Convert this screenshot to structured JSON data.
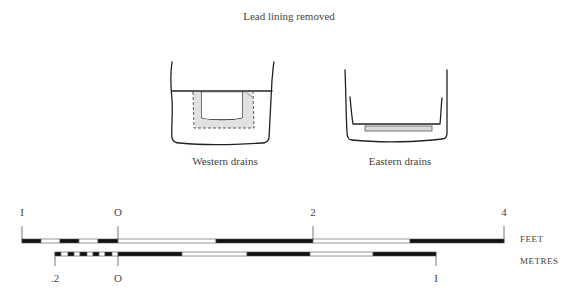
{
  "title": "Lead lining removed",
  "drawings": [
    {
      "id": "western",
      "caption": "Western drains"
    },
    {
      "id": "eastern",
      "caption": "Eastern drains"
    }
  ],
  "scales": {
    "feet": {
      "unit_label": "FEET",
      "ticks": [
        {
          "label": "I",
          "x": 22
        },
        {
          "label": "O",
          "x": 118
        },
        {
          "label": "2",
          "x": 313
        },
        {
          "label": "4",
          "x": 504
        }
      ],
      "segments": [
        {
          "x0": 22,
          "x1": 41,
          "fill": "black"
        },
        {
          "x0": 41,
          "x1": 60,
          "fill": "white"
        },
        {
          "x0": 60,
          "x1": 79,
          "fill": "black"
        },
        {
          "x0": 79,
          "x1": 98,
          "fill": "white"
        },
        {
          "x0": 98,
          "x1": 118,
          "fill": "black"
        },
        {
          "x0": 118,
          "x1": 216,
          "fill": "white"
        },
        {
          "x0": 216,
          "x1": 313,
          "fill": "black"
        },
        {
          "x0": 313,
          "x1": 410,
          "fill": "white"
        },
        {
          "x0": 410,
          "x1": 504,
          "fill": "black"
        }
      ]
    },
    "metres": {
      "unit_label": "METRES",
      "ticks": [
        {
          "label": ".2",
          "x": 55
        },
        {
          "label": "O",
          "x": 118
        },
        {
          "label": "I",
          "x": 436
        }
      ],
      "segments": [
        {
          "x0": 55,
          "x1": 61,
          "fill": "black"
        },
        {
          "x0": 61,
          "x1": 68,
          "fill": "white"
        },
        {
          "x0": 68,
          "x1": 74,
          "fill": "black"
        },
        {
          "x0": 74,
          "x1": 80,
          "fill": "white"
        },
        {
          "x0": 80,
          "x1": 87,
          "fill": "black"
        },
        {
          "x0": 87,
          "x1": 93,
          "fill": "white"
        },
        {
          "x0": 93,
          "x1": 99,
          "fill": "black"
        },
        {
          "x0": 99,
          "x1": 105,
          "fill": "white"
        },
        {
          "x0": 105,
          "x1": 112,
          "fill": "black"
        },
        {
          "x0": 112,
          "x1": 118,
          "fill": "white"
        },
        {
          "x0": 118,
          "x1": 182,
          "fill": "black"
        },
        {
          "x0": 182,
          "x1": 247,
          "fill": "white"
        },
        {
          "x0": 247,
          "x1": 310,
          "fill": "black"
        },
        {
          "x0": 310,
          "x1": 373,
          "fill": "white"
        },
        {
          "x0": 373,
          "x1": 436,
          "fill": "black"
        }
      ]
    }
  }
}
